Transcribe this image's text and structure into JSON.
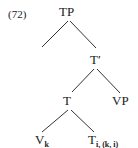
{
  "example_number": "(72)",
  "tree": {
    "root": {
      "label": "TP"
    },
    "t_bar": {
      "label": "T′"
    },
    "t": {
      "label": "T"
    },
    "vp": {
      "label": "VP"
    },
    "v": {
      "label": "V",
      "subscript": "k"
    },
    "t_trace": {
      "label": "T",
      "subscript": "i, (k, i)"
    }
  },
  "edges": [
    [
      "TP",
      "left-empty"
    ],
    [
      "TP",
      "T′"
    ],
    [
      "T′",
      "T"
    ],
    [
      "T′",
      "VP"
    ],
    [
      "T",
      "V_k"
    ],
    [
      "T",
      "T_i,(k,i)"
    ]
  ],
  "colors": {
    "text": "#1a1a1a",
    "lines": "#333333",
    "background": "#ffffff"
  }
}
